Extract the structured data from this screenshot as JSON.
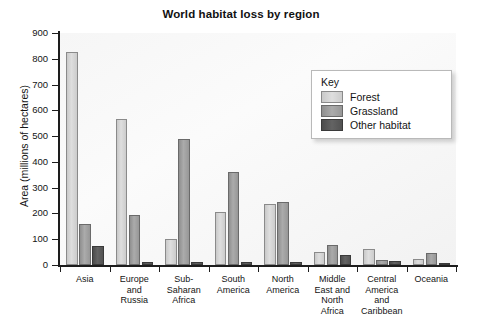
{
  "chart_data": {
    "type": "bar",
    "title": "World habitat loss by region",
    "xlabel": "",
    "ylabel": "Area (millions of hectares)",
    "ylim": [
      0,
      900
    ],
    "ytick_step": 100,
    "yticks": [
      0,
      100,
      200,
      300,
      400,
      500,
      600,
      700,
      800,
      900
    ],
    "grid": false,
    "legend_position": "top-right-inside",
    "legend_title": "Key",
    "categories": [
      "Asia",
      "Europe and Russia",
      "Sub-Saharan Africa",
      "South America",
      "North America",
      "Middle East and North Africa",
      "Central America and Caribbean",
      "Oceania"
    ],
    "category_label_lines": [
      [
        "Asia"
      ],
      [
        "Europe",
        "and",
        "Russia"
      ],
      [
        "Sub-",
        "Saharan",
        "Africa"
      ],
      [
        "South",
        "America"
      ],
      [
        "North",
        "America"
      ],
      [
        "Middle",
        "East and",
        "North",
        "Africa"
      ],
      [
        "Central",
        "America",
        "and",
        "Caribbean"
      ],
      [
        "Oceania"
      ]
    ],
    "series": [
      {
        "name": "Forest",
        "color": "#d7d7d7",
        "values": [
          825,
          565,
          100,
          205,
          235,
          50,
          62,
          25
        ]
      },
      {
        "name": "Grassland",
        "color": "#a5a5a5",
        "values": [
          160,
          195,
          490,
          360,
          245,
          78,
          18,
          48
        ]
      },
      {
        "name": "Other habitat",
        "color": "#585858",
        "values": [
          75,
          12,
          12,
          10,
          12,
          40,
          16,
          5
        ]
      }
    ]
  }
}
